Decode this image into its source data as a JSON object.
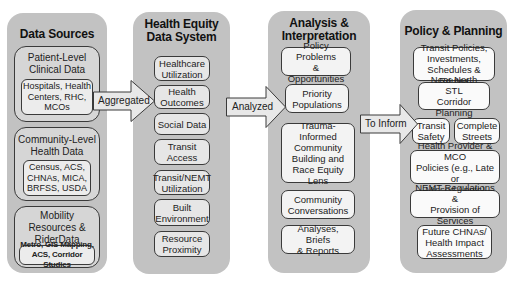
{
  "columns": [
    {
      "title": "Data Sources",
      "groups": [
        {
          "label": "Patient-Level\nClinical Data",
          "sub": "Hospitals, Health\nCenters, RHC,\nMCOs"
        },
        {
          "label": "Community-Level\nHealth Data",
          "sub": "Census, ACS,\nCHNAs, MICA,\nBRFSS, USDA"
        },
        {
          "label": "Mobility\nResources &\nRiderData",
          "sub": "Metro, GIS Mapping,\nACS, Corridor Studies"
        }
      ]
    },
    {
      "title": "Health Equity\nData System",
      "items": [
        "Healthcare\nUtilization",
        "Health\nOutcomes",
        "Social Data",
        "Transit Access",
        "Transit/NEMT\nUtilization",
        "Built\nEnvironment",
        "Resource\nProximity"
      ]
    },
    {
      "title": "Analysis &\nInterpretation",
      "items": [
        "Policy Problems\n& Opportunities",
        "Priority\nPopulations",
        "Trauma-\nInformed\nCommunity\nBuilding and\nRace Equity Lens",
        "Community\nConversations",
        "Analyses, Briefs\n& Reports"
      ]
    },
    {
      "title": "Policy & Planning",
      "items": [
        "Transit Policies,\nInvestments,\nSchedules & Routes",
        "Near North STL\nCorridor Planning",
        "Transit\nSafety",
        "Complete\nStreets",
        "Health Provider & MCO\nPolicies (e.g., Late or\nMissed Appts)",
        "NEMT Regulations &\nProvision of Services",
        "Future CHNAs/\nHealth Impact\nAssessments"
      ]
    }
  ],
  "arrows": [
    {
      "label": "Aggregated"
    },
    {
      "label": "Analyzed"
    },
    {
      "label": "To Inform"
    }
  ],
  "colors": {
    "column_fill": "#c2c2c2",
    "arrow_fill": "#e8e8e8",
    "border": "#3a3a3a"
  }
}
